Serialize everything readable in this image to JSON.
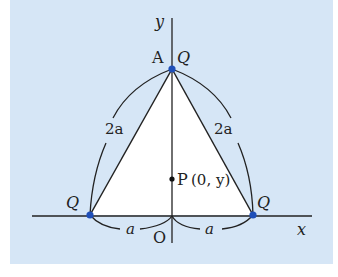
{
  "diagram": {
    "type": "geometry-coordinate-figure",
    "axes": {
      "x_label": "x",
      "y_label": "y",
      "origin_label": "O"
    },
    "points": [
      {
        "id": "A",
        "label": "A",
        "charge_label": "Q",
        "coords": "(0, √3a)"
      },
      {
        "id": "left",
        "charge_label": "Q",
        "coords": "(-a, 0)"
      },
      {
        "id": "right",
        "charge_label": "Q",
        "coords": "(a, 0)"
      },
      {
        "id": "P",
        "label": "P",
        "coord_label": "(0, y)"
      }
    ],
    "segment_labels": {
      "left_side": "2a",
      "right_side": "2a",
      "left_base": "a",
      "right_base": "a"
    },
    "colors": {
      "background": "#d6e6f6",
      "triangle_fill": "#ffffff",
      "charge_dot": "#1f4fb8",
      "line": "#222222"
    }
  }
}
